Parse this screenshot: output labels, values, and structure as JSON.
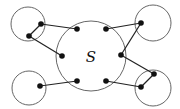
{
  "diagram": {
    "central_label": "S",
    "stroke_color": "#666666",
    "edge_color": "#222222",
    "dot_color": "#111111",
    "circles": [
      {
        "id": "central",
        "cx": 91,
        "cy": 56,
        "r": 35
      },
      {
        "id": "top-left",
        "cx": 28,
        "cy": 24,
        "r": 17
      },
      {
        "id": "top-right",
        "cx": 153,
        "cy": 23,
        "r": 18
      },
      {
        "id": "bottom-left",
        "cx": 29,
        "cy": 88,
        "r": 17
      },
      {
        "id": "bottom-right",
        "cx": 153,
        "cy": 88,
        "r": 18
      }
    ],
    "dots": [
      {
        "id": "s-top-left",
        "x": 77,
        "y": 29
      },
      {
        "id": "s-top-right",
        "x": 106,
        "y": 29
      },
      {
        "id": "s-left",
        "x": 62,
        "y": 56
      },
      {
        "id": "s-right",
        "x": 121,
        "y": 55
      },
      {
        "id": "s-bottom-left",
        "x": 77,
        "y": 81
      },
      {
        "id": "s-bottom-right",
        "x": 106,
        "y": 81
      },
      {
        "id": "tl-a",
        "x": 41,
        "y": 24
      },
      {
        "id": "tl-b",
        "x": 29,
        "y": 36
      },
      {
        "id": "tr-a",
        "x": 141,
        "y": 23
      },
      {
        "id": "bl-a",
        "x": 40,
        "y": 86
      },
      {
        "id": "br-a",
        "x": 154,
        "y": 74
      },
      {
        "id": "br-b",
        "x": 141,
        "y": 87
      }
    ],
    "edges": [
      [
        "tl-a",
        "s-top-left"
      ],
      [
        "tl-a",
        "tl-b"
      ],
      [
        "tl-b",
        "s-left"
      ],
      [
        "s-top-right",
        "tr-a"
      ],
      [
        "tr-a",
        "s-right"
      ],
      [
        "bl-a",
        "s-bottom-left"
      ],
      [
        "s-right",
        "br-a"
      ],
      [
        "br-a",
        "br-b"
      ],
      [
        "s-bottom-right",
        "br-b"
      ]
    ]
  }
}
